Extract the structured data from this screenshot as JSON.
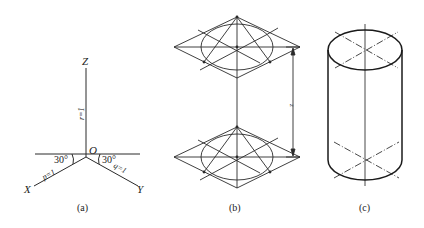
{
  "figure_a": {
    "caption": "(a)",
    "axes": {
      "x": "X",
      "y": "Y",
      "z": "Z",
      "origin": "O"
    },
    "angles": {
      "left": "30°",
      "right": "30°"
    },
    "coefficients": {
      "x": "p=1",
      "y": "q=1",
      "z": "r=1"
    }
  },
  "figure_b": {
    "caption": "(b)",
    "dimension_label": "z"
  },
  "figure_c": {
    "caption": "(c)"
  },
  "colors": {
    "line": "#2a2a2a",
    "background": "#ffffff"
  }
}
